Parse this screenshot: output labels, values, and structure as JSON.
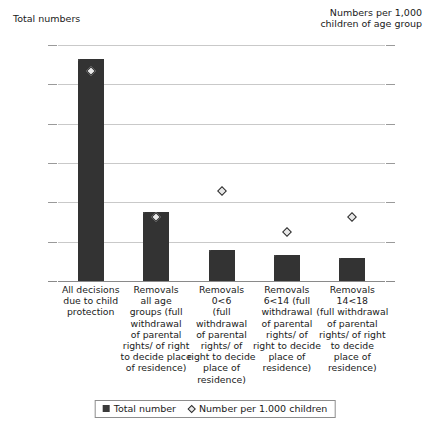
{
  "chart_data": {
    "type": "bar",
    "title": "",
    "left_axis_caption": "Total numbers",
    "right_axis_caption": "Numbers per 1,000\nchildren of age group",
    "categories": [
      "All decisions\ndue to child\nprotection",
      "Removals\nall age\ngroups (full\nwithdrawal\nof parental\nrights/ of right\nto decide place\nof residence)",
      "Removals\n0<6\n(full withdrawal\nof parental\nrights/ of\nright to decide\nplace of\nresidence)",
      "Removals\n6<14 (full\nwithdrawal\nof parental\nrights/ of\nright to decide\nplace of\nresidence)",
      "Removals\n14<18\n(full withdrawal\nof parental\nrights/ of right\nto decide\nplace of\nresidence)"
    ],
    "series": [
      {
        "name": "Total number",
        "axis": "left",
        "type": "bar",
        "values": [
          28200,
          8800,
          3900,
          3300,
          2900
        ]
      },
      {
        "name": "Number per 1.000 children",
        "axis": "right",
        "type": "scatter",
        "values": [
          2.22,
          0.68,
          0.95,
          0.52,
          0.68
        ]
      }
    ],
    "left_axis": {
      "label": "Total numbers",
      "min": 0,
      "max": 30000,
      "ticks": [
        0,
        5000,
        10000,
        15000,
        20000,
        25000,
        30000
      ],
      "tick_labels": [
        "0",
        "5,000",
        "10,000",
        "15,000",
        "20,000",
        "25,000",
        "30,000"
      ]
    },
    "right_axis": {
      "label": "Numbers per 1,000 children of age group",
      "min": 0,
      "max": 2.5,
      "ticks": [
        0,
        0.5,
        1,
        1.5,
        2,
        2.5
      ],
      "tick_labels": [
        "0",
        "0.5",
        "1",
        "1.5",
        "2",
        "2.5"
      ]
    },
    "grid": true,
    "legend_position": "bottom",
    "legend": [
      "Total number",
      "Number per 1.000 children"
    ],
    "colors": {
      "bar": "#3a3a3a",
      "marker_fill": "#e8e8e8",
      "marker_edge": "#2b2b2b",
      "grid": "#c9c9c9",
      "axis": "#8a8a8a",
      "text": "#1a1a1a"
    }
  }
}
